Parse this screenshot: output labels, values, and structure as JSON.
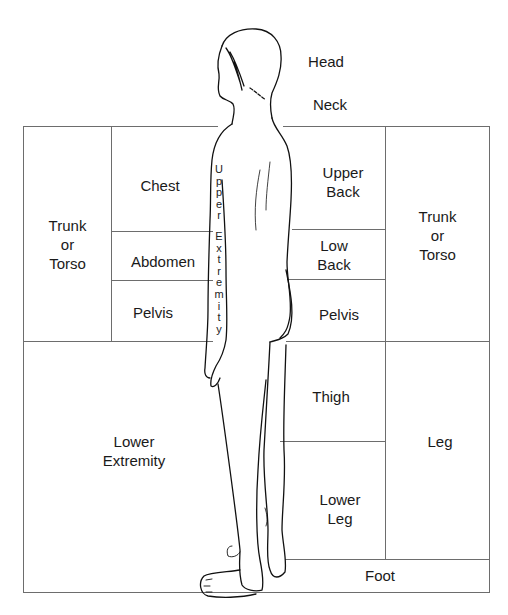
{
  "diagram": {
    "figure": "standing-human-figure-side-back-view",
    "labels": {
      "head": "Head",
      "neck": "Neck",
      "trunk_left": "Trunk\nor\nTorso",
      "chest": "Chest",
      "abdomen": "Abdomen",
      "pelvis_front": "Pelvis",
      "upper_extremity": "Upper Extremity",
      "upper_back": "Upper\nBack",
      "low_back": "Low\nBack",
      "pelvis_back": "Pelvis",
      "trunk_right": "Trunk\nor\nTorso",
      "lower_extremity": "Lower\nExtremity",
      "thigh": "Thigh",
      "lower_leg": "Lower\nLeg",
      "leg": "Leg",
      "foot": "Foot"
    },
    "upper_extremity_letters": [
      "U",
      "p",
      "p",
      "e",
      "r",
      "",
      "E",
      "x",
      "t",
      "r",
      "e",
      "m",
      "i",
      "t",
      "y"
    ],
    "colors": {
      "lines": "#6d6d6d",
      "text": "#1a1a1a",
      "background": "#ffffff"
    }
  }
}
